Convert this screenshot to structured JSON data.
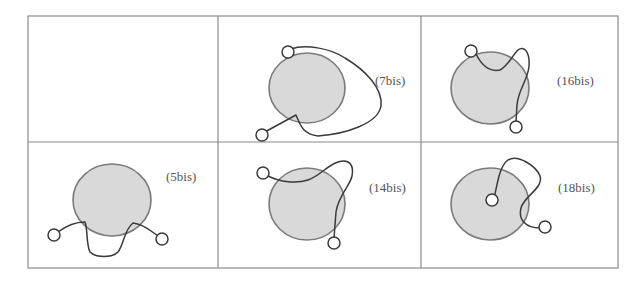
{
  "figure": {
    "layout": {
      "rows": 2,
      "columns": 3
    },
    "colors": {
      "grid": "#8a8a8a",
      "blob_fill": "#d9d9d9",
      "blob_stroke": "#7a7a7a",
      "strand": "#3a3a3a",
      "label": "#555555"
    },
    "cells": [
      {
        "row": 0,
        "col": 0,
        "label": "",
        "empty": true
      },
      {
        "row": 0,
        "col": 1,
        "label": "(7bis)"
      },
      {
        "row": 0,
        "col": 2,
        "label": "(16bis)"
      },
      {
        "row": 1,
        "col": 0,
        "label": "(5bis)"
      },
      {
        "row": 1,
        "col": 1,
        "label": "(14bis)"
      },
      {
        "row": 1,
        "col": 2,
        "label": "(18bis)"
      }
    ]
  }
}
